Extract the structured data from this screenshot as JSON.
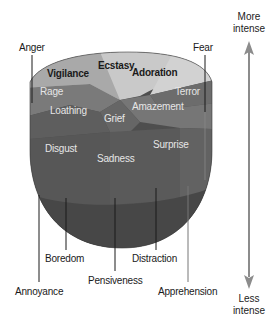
{
  "diagram": {
    "title": "",
    "type": "emotion-cone",
    "colors": {
      "top_ring": "#c8c8c8",
      "mid_ring": "#8a8a8a",
      "body_dark": "#555555",
      "body_darker": "#4a4a4a",
      "arrow": "#8c8c8c",
      "leader_line": "#1a1a1a"
    },
    "top_segments": [
      {
        "label": "Ecstasy"
      },
      {
        "label": "Adoration"
      },
      {
        "label": "Vigilance"
      }
    ],
    "mid_segments": [
      {
        "label": "Rage"
      },
      {
        "label": "Terror"
      },
      {
        "label": "Loathing"
      },
      {
        "label": "Amazement"
      },
      {
        "label": "Grief"
      }
    ],
    "body_segments": [
      {
        "label": "Disgust"
      },
      {
        "label": "Sadness"
      },
      {
        "label": "Surprise"
      }
    ],
    "outer_labels": {
      "anger": "Anger",
      "fear": "Fear",
      "annoyance": "Annoyance",
      "boredom": "Boredom",
      "pensiveness": "Pensiveness",
      "distraction": "Distraction",
      "apprehension": "Apprehension"
    },
    "intensity_arrow": {
      "top_label_line1": "More",
      "top_label_line2": "intense",
      "bottom_label_line1": "Less",
      "bottom_label_line2": "intense"
    }
  }
}
